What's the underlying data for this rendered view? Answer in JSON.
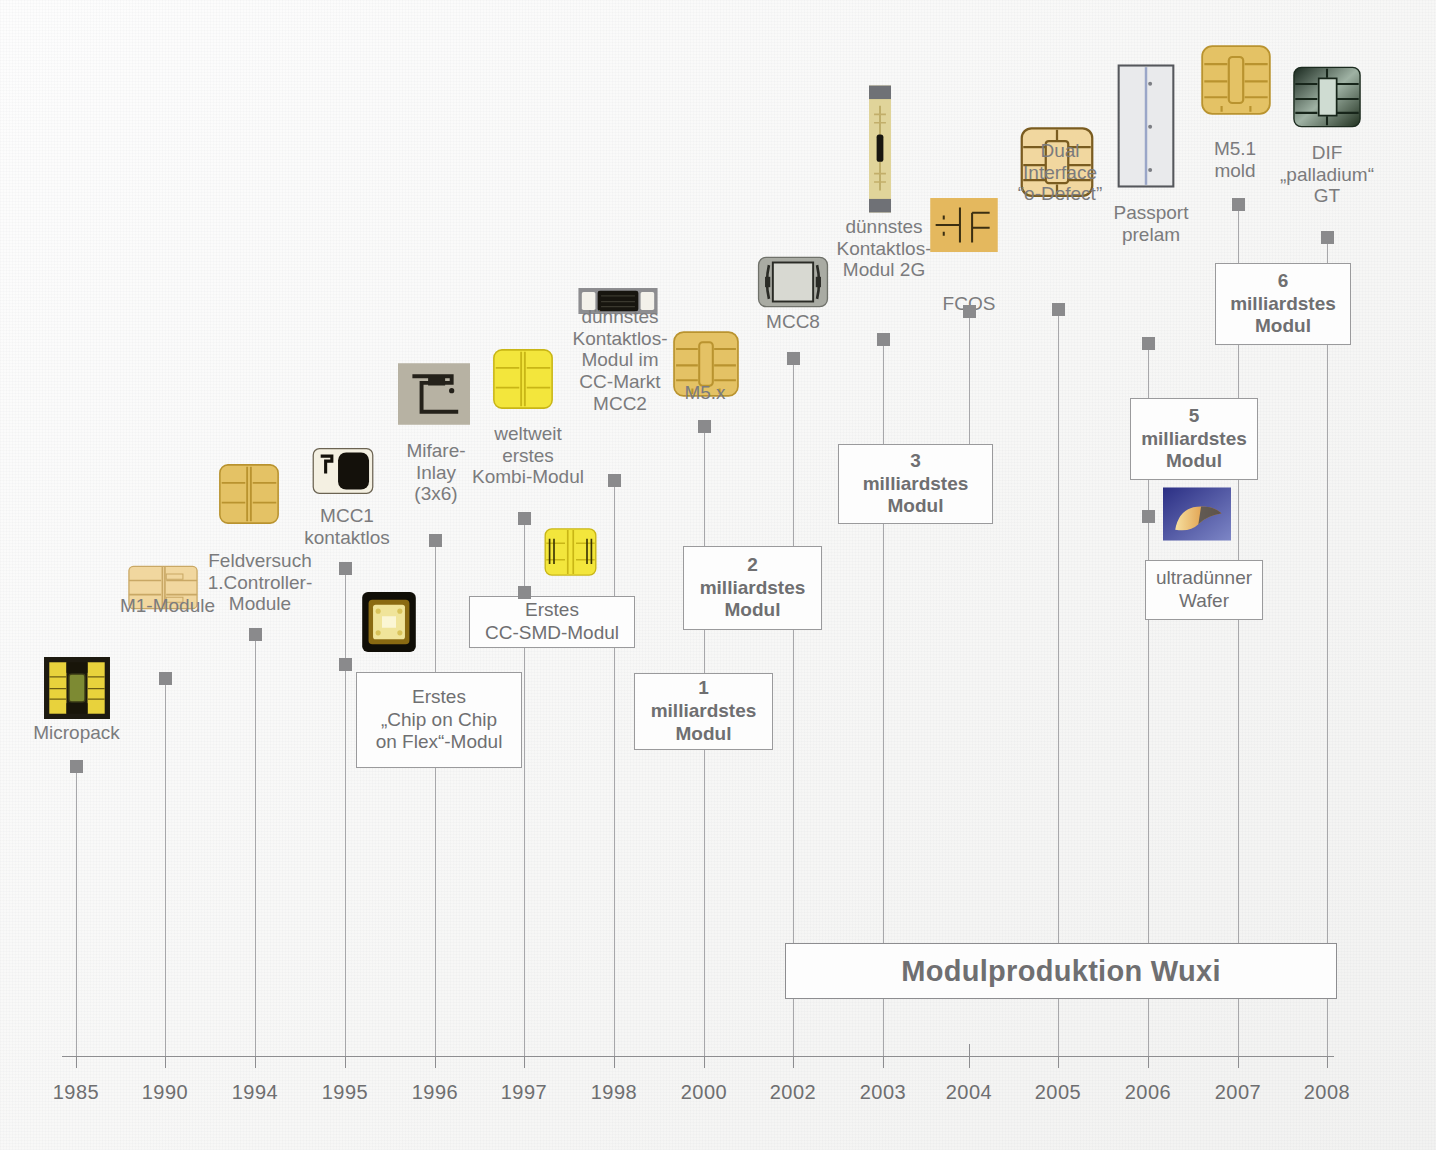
{
  "axis": {
    "years": [
      "1985",
      "1990",
      "1994",
      "1995",
      "1996",
      "1997",
      "1998",
      "2000",
      "2002",
      "2003",
      "2004",
      "2005",
      "2006",
      "2007",
      "2008"
    ]
  },
  "banner": {
    "label": "Modulproduktion Wuxi"
  },
  "events": [
    {
      "id": "micropack",
      "year": "1985",
      "caption": "Micropack",
      "thumb": "micropack"
    },
    {
      "id": "m1-module",
      "year": "1990",
      "caption": "M1-Module",
      "thumb": "m1-module"
    },
    {
      "id": "feldversuch",
      "year": "1994",
      "caption": "Feldversuch\n1.Controller-\nModule",
      "thumb": "feldversuch"
    },
    {
      "id": "mcc1-kontaktlos",
      "year": "1995",
      "caption": "MCC1\nkontaktlos",
      "thumb": "mcc1"
    },
    {
      "id": "chip-on-chip",
      "year": "1995",
      "caption": "Erstes\n„Chip on Chip\non Flex“-Modul",
      "thumb": "chip-on-chip",
      "box": true
    },
    {
      "id": "mifare-inlay",
      "year": "1996",
      "caption": "Mifare-\nInlay\n(3x6)",
      "thumb": "mifare"
    },
    {
      "id": "kombi-modul",
      "year": "1997",
      "caption": "weltweit\nerstes\nKombi-Modul",
      "thumb": "kombi"
    },
    {
      "id": "cc-smd-modul",
      "year": "1997",
      "caption": "Erstes\nCC-SMD-Modul",
      "thumb": "ccsmd",
      "box": true
    },
    {
      "id": "mcc2",
      "year": "1998",
      "caption": "dünnstes\nKontaktlos-\nModul im\nCC-Markt\nMCC2",
      "thumb": "mcc2"
    },
    {
      "id": "m5x",
      "year": "2000",
      "caption": "M5.x",
      "thumb": "m5x"
    },
    {
      "id": "milliard-1",
      "year": "2000",
      "caption": "1\nmilliardstes\nModul",
      "box": true
    },
    {
      "id": "milliard-2",
      "year": "2000",
      "caption": "2\nmilliardstes\nModul",
      "box": true
    },
    {
      "id": "mcc8",
      "year": "2002",
      "caption": "MCC8",
      "thumb": "mcc8"
    },
    {
      "id": "kontaktlos-2g",
      "year": "2003",
      "caption": "dünnstes\nKontaktlos-\nModul 2G",
      "thumb": "kontaktlos2g"
    },
    {
      "id": "milliard-3",
      "year": "2003",
      "caption": "3\nmilliardstes\nModul",
      "box": true
    },
    {
      "id": "fcos",
      "year": "2004",
      "caption": "FCOS",
      "thumb": "fcos"
    },
    {
      "id": "dual-interface",
      "year": "2005",
      "caption": "Dual\nInterface\n“o-Defect”",
      "thumb": "dif"
    },
    {
      "id": "passport-prelam",
      "year": "2006",
      "caption": "Passport\nprelam",
      "thumb": "passport"
    },
    {
      "id": "milliard-5",
      "year": "2006",
      "caption": "5\nmilliardstes\nModul",
      "box": true
    },
    {
      "id": "ultraduenner",
      "year": "2006",
      "caption": "ultradünner\nWafer",
      "thumb": "wafer",
      "box": true
    },
    {
      "id": "m51-mold",
      "year": "2007",
      "caption": "M5.1\nmold",
      "thumb": "m51"
    },
    {
      "id": "milliard-6",
      "year": "2007",
      "caption": "6\nmilliardstes\nModul",
      "box": true
    },
    {
      "id": "dif-palladium",
      "year": "2008",
      "caption": "DIF\n„palladium“\nGT",
      "thumb": "palladium"
    }
  ],
  "colors": {
    "ink": "#7b7b7d",
    "line": "#a7a7aa",
    "axis": "#8d8d90",
    "marker": "#8a8a8c",
    "chip_gold": "#e9c96a",
    "chip_yellow": "#f2e33a",
    "chip_tan": "#f0d49a",
    "chip_dark": "#2a2418",
    "box_bg": "#fdfdfd"
  }
}
